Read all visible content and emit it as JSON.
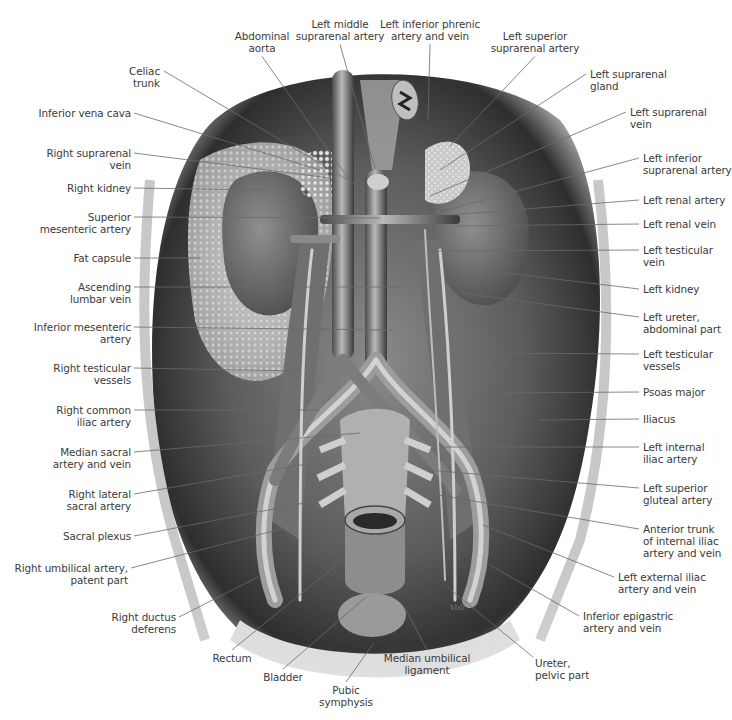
{
  "figure": {
    "palette": {
      "background": "#ffffff",
      "label_text": "#3a3a3a",
      "leader_line": "#6a6a6a",
      "tissue_dark": "#2a2a2a",
      "tissue_mid": "#7a7a7a",
      "tissue_light": "#d8d8d8"
    },
    "signature": "Voll",
    "labels_top": [
      {
        "id": "abdominal-aorta",
        "text": "Abdominal\naorta",
        "x": 262,
        "y": 30,
        "align": "c",
        "anchor": [
          348,
          178
        ]
      },
      {
        "id": "left-middle-suprarenal-artery",
        "text": "Left middle\nsuprarenal artery",
        "x": 340,
        "y": 18,
        "align": "c",
        "anchor": [
          375,
          168
        ]
      },
      {
        "id": "left-inferior-phrenic-artery-and-vein",
        "text": "Left inferior phrenic\nartery and vein",
        "x": 430,
        "y": 18,
        "align": "c",
        "anchor": [
          428,
          120
        ]
      },
      {
        "id": "left-superior-suprarenal-artery",
        "text": "Left superior\nsuprarenal artery",
        "x": 535,
        "y": 30,
        "align": "c",
        "anchor": [
          450,
          146
        ]
      },
      {
        "id": "celiac-trunk",
        "text": "Celiac\ntrunk",
        "x": 160,
        "y": 65,
        "align": "r",
        "anchor": [
          368,
          192
        ]
      }
    ],
    "labels_left": [
      {
        "id": "inferior-vena-cava",
        "text": "Inferior vena cava",
        "y": 107,
        "anchor": [
          320,
          170
        ]
      },
      {
        "id": "right-suprarenal-vein",
        "text": "Right suprarenal\nvein",
        "y": 147,
        "anchor": [
          330,
          178
        ]
      },
      {
        "id": "right-kidney",
        "text": "Right kidney",
        "y": 182,
        "anchor": [
          265,
          190
        ]
      },
      {
        "id": "superior-mesenteric-artery",
        "text": "Superior\nmesenteric artery",
        "y": 211,
        "anchor": [
          380,
          218
        ]
      },
      {
        "id": "fat-capsule",
        "text": "Fat capsule",
        "y": 252,
        "anchor": [
          200,
          258
        ]
      },
      {
        "id": "ascending-lumbar-vein",
        "text": "Ascending\nlumbar vein",
        "y": 281,
        "anchor": [
          405,
          287
        ]
      },
      {
        "id": "inferior-mesenteric-artery",
        "text": "Inferior mesenteric\nartery",
        "y": 321,
        "anchor": [
          392,
          330
        ]
      },
      {
        "id": "right-testicular-vessels",
        "text": "Right testicular\nvessels",
        "y": 362,
        "anchor": [
          300,
          371
        ]
      },
      {
        "id": "right-common-iliac-artery",
        "text": "Right common\niliac artery",
        "y": 404,
        "anchor": [
          320,
          410
        ]
      },
      {
        "id": "median-sacral-artery-and-vein",
        "text": "Median sacral\nartery and vein",
        "y": 446,
        "anchor": [
          360,
          433
        ]
      },
      {
        "id": "right-lateral-sacral-artery",
        "text": "Right lateral\nsacral artery",
        "y": 488,
        "anchor": [
          330,
          460
        ]
      },
      {
        "id": "sacral-plexus",
        "text": "Sacral plexus",
        "y": 530,
        "anchor": [
          320,
          500
        ]
      },
      {
        "id": "right-umbilical-artery-patent-part",
        "text": "Right umbilical artery,\npatent part",
        "y": 562,
        "anchor": [
          285,
          528
        ],
        "x_right": 127
      },
      {
        "id": "right-ductus-deferens",
        "text": "Right ductus\ndeferens",
        "y": 611,
        "anchor": [
          258,
          577
        ],
        "x_right": 175
      }
    ],
    "labels_right": [
      {
        "id": "left-suprarenal-gland",
        "text": "Left suprarenal\ngland",
        "x": 590,
        "y": 68,
        "anchor": [
          440,
          170
        ]
      },
      {
        "id": "left-suprarenal-vein",
        "text": "Left suprarenal\nvein",
        "x": 630,
        "y": 106,
        "anchor": [
          430,
          196
        ]
      },
      {
        "id": "left-inferior-suprarenal-artery",
        "text": "Left inferior\nsuprarenal artery",
        "x": 643,
        "y": 152,
        "anchor": [
          440,
          212
        ]
      },
      {
        "id": "left-renal-artery",
        "text": "Left renal artery",
        "x": 643,
        "y": 194,
        "anchor": [
          450,
          215
        ]
      },
      {
        "id": "left-renal-vein",
        "text": "Left renal vein",
        "x": 643,
        "y": 218,
        "anchor": [
          455,
          226
        ]
      },
      {
        "id": "left-testicular-vein",
        "text": "Left testicular\nvein",
        "x": 643,
        "y": 244,
        "anchor": [
          428,
          251
        ]
      },
      {
        "id": "left-kidney",
        "text": "Left kidney",
        "x": 643,
        "y": 283,
        "anchor": [
          497,
          272
        ]
      },
      {
        "id": "left-ureter-abdominal-part",
        "text": "Left ureter,\nabdominal part",
        "x": 643,
        "y": 311,
        "anchor": [
          446,
          291
        ]
      },
      {
        "id": "left-testicular-vessels",
        "text": "Left testicular\nvessels",
        "x": 643,
        "y": 348,
        "anchor": [
          453,
          353
        ]
      },
      {
        "id": "psoas-major",
        "text": "Psoas major",
        "x": 643,
        "y": 386,
        "anchor": [
          484,
          393
        ]
      },
      {
        "id": "iliacus",
        "text": "Iliacus",
        "x": 643,
        "y": 413,
        "anchor": [
          540,
          420
        ]
      },
      {
        "id": "left-internal-iliac-artery",
        "text": "Left internal\niliac artery",
        "x": 643,
        "y": 441,
        "anchor": [
          440,
          447
        ]
      },
      {
        "id": "left-superior-gluteal-artery",
        "text": "Left superior\ngluteal artery",
        "x": 643,
        "y": 482,
        "anchor": [
          428,
          470
        ]
      },
      {
        "id": "anterior-trunk-of-internal-iliac-artery-and-vein",
        "text": "Anterior trunk\nof internal iliac\nartery and vein",
        "x": 643,
        "y": 523,
        "anchor": [
          432,
          494
        ]
      },
      {
        "id": "left-external-iliac-artery-and-vein",
        "text": "Left external iliac\nartery and vein",
        "x": 618,
        "y": 571,
        "anchor": [
          483,
          525
        ]
      },
      {
        "id": "inferior-epigastric-artery-and-vein",
        "text": "Inferior epigastric\nartery and vein",
        "x": 583,
        "y": 610,
        "anchor": [
          490,
          565
        ]
      }
    ],
    "labels_bottom": [
      {
        "id": "rectum",
        "text": "Rectum",
        "x": 232,
        "y": 652,
        "align": "c",
        "anchor": [
          340,
          562
        ]
      },
      {
        "id": "bladder",
        "text": "Bladder",
        "x": 283,
        "y": 671,
        "align": "c",
        "anchor": [
          366,
          597
        ]
      },
      {
        "id": "pubic-symphysis",
        "text": "Pubic\nsymphysis",
        "x": 346,
        "y": 684,
        "align": "c",
        "anchor": [
          373,
          644
        ]
      },
      {
        "id": "median-umbilical-ligament",
        "text": "Median umbilical\nligament",
        "x": 427,
        "y": 652,
        "align": "c",
        "anchor": [
          405,
          608
        ]
      },
      {
        "id": "ureter-pelvic-part",
        "text": "Ureter,\npelvic part",
        "x": 535,
        "y": 657,
        "align": "l",
        "anchor": [
          446,
          586
        ]
      }
    ]
  }
}
